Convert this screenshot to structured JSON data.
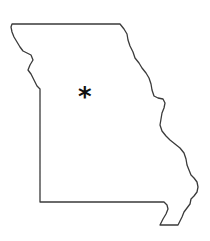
{
  "map": {
    "region": "Missouri",
    "outline_color": "#3a3a3a",
    "background": "#ffffff",
    "outline_points": "12,24 120,24 124,29 127,34 128,40 130,46 133,52 135,58 139,63 142,68 146,73 149,78 151,84 152,90 154,96 158,98 163,99 165,103 164,108 162,113 161,119 160,125 162,131 166,136 170,140 175,144 180,148 184,153 186,159 187,165 189,170 191,175 194,178 197,182 198,187 197,192 194,196 191,199 190,204 187,208 184,212 182,217 180,221 178,225 160,225 163,219 166,214 168,209 167,205 164,202 40,202 40,89 37,86 34,80 31,74 28,70 30,65 33,60 31,55 27,53 23,51 20,47 17,42 14,37 12,32 11,27 12,24",
    "marker": {
      "symbol": "*",
      "x": 78,
      "y": 84,
      "label": "state-capital-marker"
    }
  }
}
